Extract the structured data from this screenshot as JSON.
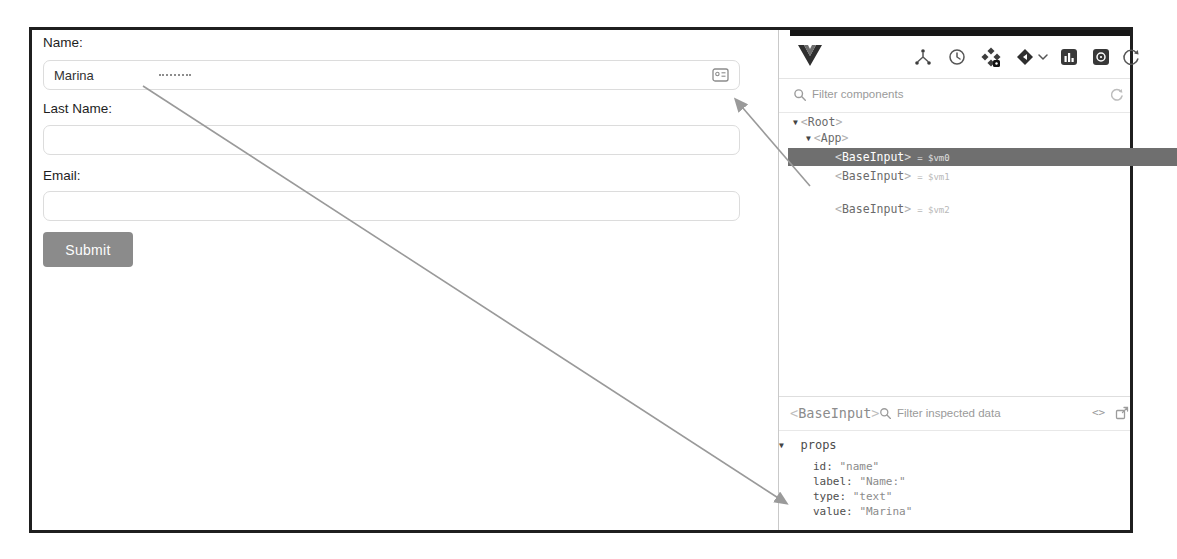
{
  "form": {
    "fields": [
      {
        "label": "Name:",
        "value": "Marina",
        "has_contact_icon": true
      },
      {
        "label": "Last Name:",
        "value": ""
      },
      {
        "label": "Email:",
        "value": ""
      }
    ],
    "submit_label": "Submit"
  },
  "devtools": {
    "brackets": {
      "open": "<",
      "close": ">"
    },
    "toolbar_icons": [
      "vue-logo",
      "components",
      "timeline",
      "plugins",
      "app-selector",
      "chart",
      "snapshot",
      "refresh"
    ],
    "filter_components_placeholder": "Filter components",
    "tree": {
      "root_tag": "Root",
      "app_tag": "App",
      "children": [
        {
          "tag": "BaseInput",
          "suffix": "= $vm0",
          "selected": true
        },
        {
          "tag": "BaseInput",
          "suffix": "= $vm1",
          "selected": false
        },
        {
          "tag": "BaseInput",
          "suffix": "= $vm2",
          "selected": false
        }
      ]
    },
    "inspector": {
      "component_tag": "BaseInput",
      "filter_placeholder": "Filter inspected data",
      "section_title": "props",
      "props": [
        {
          "key": "id:",
          "value": "\"name\""
        },
        {
          "key": "label:",
          "value": "\"Name:\""
        },
        {
          "key": "type:",
          "value": "\"text\""
        },
        {
          "key": "value:",
          "value": "\"Marina\""
        }
      ]
    }
  },
  "colors": {
    "frame_border": "#1f1f1f",
    "selected_row_bg": "#6f6f6f",
    "submit_bg": "#8b8b8b",
    "arrow": "#9a9a9a",
    "input_border": "#dcdcdc"
  }
}
